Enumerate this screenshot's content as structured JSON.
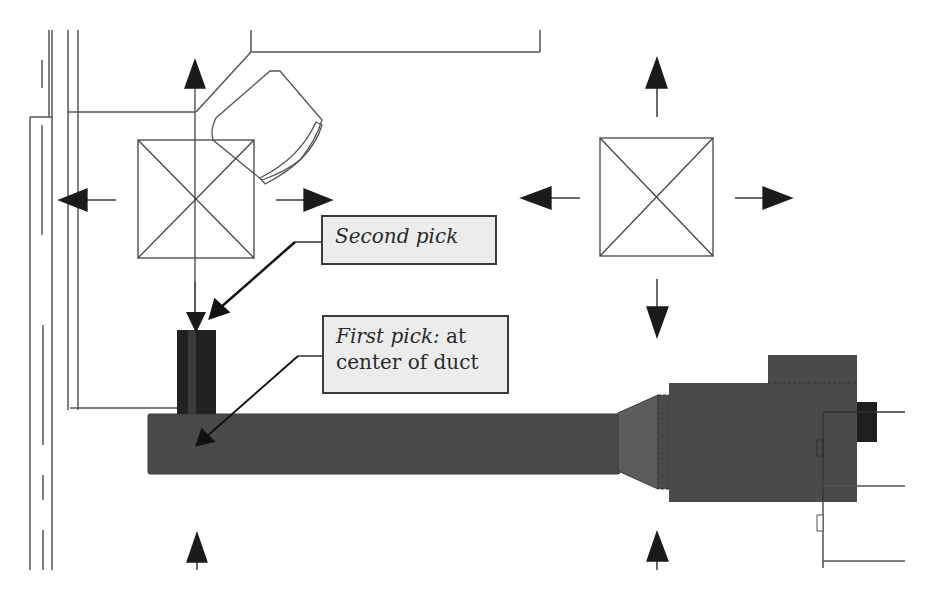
{
  "diagram": {
    "colors": {
      "line": "#3a3a3a",
      "duct_fill": "#4a4a4a",
      "fitting_fill": "#5c5c5c",
      "vertical_duct_fill": "#222222",
      "callout_bg": "#ececec",
      "arrow": "#1a1a1a"
    },
    "callouts": [
      {
        "id": "second-pick",
        "italic": "Second pick",
        "normal": ""
      },
      {
        "id": "first-pick",
        "italic": "First pick:",
        "normal_line1": " at",
        "normal_line2": "center of duct"
      }
    ],
    "elements": [
      "diffuser-left",
      "diffuser-right",
      "main-duct",
      "vertical-duct",
      "transition-fitting",
      "air-handling-unit",
      "wall-lines",
      "chair"
    ]
  }
}
